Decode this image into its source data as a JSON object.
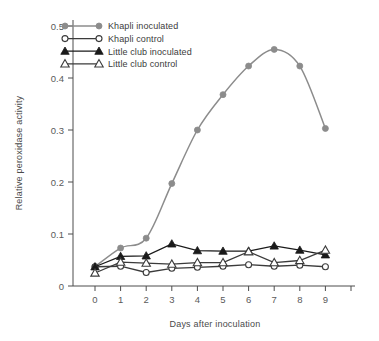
{
  "chart_data": {
    "type": "line",
    "title": "",
    "xlabel": "Days after inoculation",
    "ylabel": "Relative peroxidase activity",
    "x": [
      0,
      1,
      2,
      3,
      4,
      5,
      6,
      7,
      8,
      9
    ],
    "xticklabels": [
      "0",
      "1",
      "2",
      "3",
      "4",
      "5",
      "6",
      "7",
      "8",
      "9"
    ],
    "yticklabels": [
      "0",
      "0.1",
      "0.2",
      "0.3",
      "0.4",
      "0.5"
    ],
    "yticks": [
      0,
      0.1,
      0.2,
      0.3,
      0.4,
      0.5
    ],
    "xlim": [
      -0.6,
      10.4
    ],
    "ylim": [
      0,
      0.52
    ],
    "grid": false,
    "legend_position": "top-left inside",
    "series": [
      {
        "name": "Khapli  inoculated",
        "marker": "filled-circle",
        "color": "#8c8c8c",
        "values": [
          0.037,
          0.073,
          0.092,
          0.197,
          0.3,
          0.368,
          0.423,
          0.455,
          0.423,
          0.303
        ]
      },
      {
        "name": "Khapli  control",
        "marker": "open-circle",
        "color": "#3b3b3b",
        "values": [
          0.037,
          0.038,
          0.026,
          0.034,
          0.036,
          0.038,
          0.041,
          0.038,
          0.04,
          0.037
        ]
      },
      {
        "name": "Little club inoculated",
        "marker": "filled-triangle",
        "color": "#1a1a1a",
        "values": [
          0.037,
          0.057,
          0.058,
          0.081,
          0.068,
          0.067,
          0.067,
          0.077,
          0.069,
          0.06
        ]
      },
      {
        "name": "Little club control",
        "marker": "open-triangle",
        "color": "#3b3b3b",
        "values": [
          0.025,
          0.046,
          0.044,
          0.042,
          0.045,
          0.045,
          0.066,
          0.045,
          0.049,
          0.069
        ]
      }
    ]
  }
}
